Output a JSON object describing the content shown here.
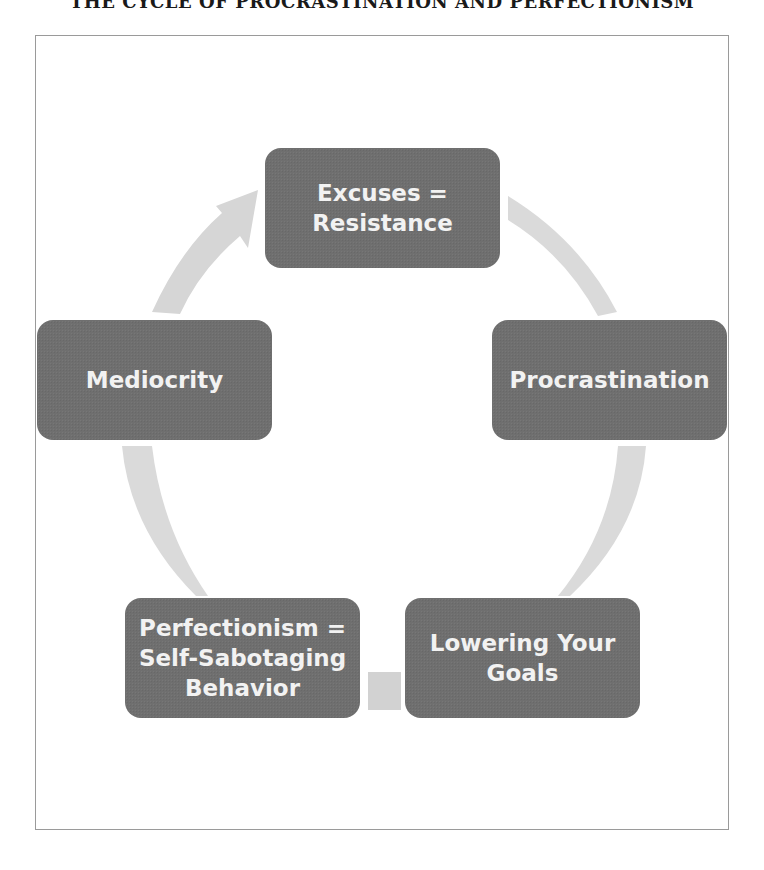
{
  "title": "THE CYCLE OF PROCRASTINATION AND PERFECTIONISM",
  "diagram": {
    "type": "cycle",
    "nodes": [
      {
        "id": "excuses",
        "label": "Excuses =\nResistance"
      },
      {
        "id": "procrastination",
        "label": "Procrastination"
      },
      {
        "id": "lowering-goals",
        "label": "Lowering Your\nGoals"
      },
      {
        "id": "perfectionism",
        "label": "Perfectionism =\nSelf-Sabotaging\nBehavior"
      },
      {
        "id": "mediocrity",
        "label": "Mediocrity"
      }
    ],
    "edges": [
      {
        "from": "excuses",
        "to": "procrastination"
      },
      {
        "from": "procrastination",
        "to": "lowering-goals"
      },
      {
        "from": "lowering-goals",
        "to": "perfectionism"
      },
      {
        "from": "perfectionism",
        "to": "mediocrity"
      },
      {
        "from": "mediocrity",
        "to": "excuses"
      }
    ]
  },
  "colors": {
    "node_fill": "#6f6f6f",
    "node_text": "#f2f2f2",
    "arrow_fill": "#d8d8d8",
    "frame_border": "#9a9a9a",
    "title_text": "#1a1a1a"
  }
}
